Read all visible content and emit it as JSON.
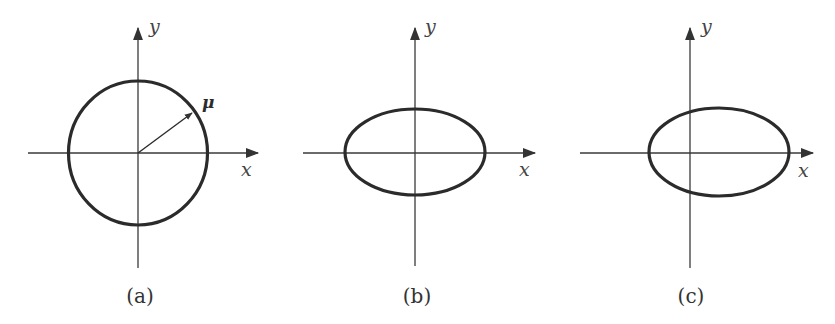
{
  "figure": {
    "panels": [
      {
        "id": "a",
        "caption": "(a)",
        "shape": "circle",
        "x_axis_label": "x",
        "y_axis_label": "y",
        "vector_label": "μ",
        "origin": [
          138,
          153
        ],
        "shape_center": [
          138,
          153
        ],
        "rx": 70,
        "ry": 72
      },
      {
        "id": "b",
        "caption": "(b)",
        "shape": "ellipse",
        "x_axis_label": "x",
        "y_axis_label": "y",
        "origin": [
          415,
          153
        ],
        "shape_center": [
          415,
          152
        ],
        "rx": 70,
        "ry": 43
      },
      {
        "id": "c",
        "caption": "(c)",
        "shape": "ellipse (shifted right)",
        "x_axis_label": "x",
        "y_axis_label": "y",
        "origin": [
          690,
          153
        ],
        "shape_center": [
          719,
          152
        ],
        "rx": 70,
        "ry": 44
      }
    ]
  }
}
